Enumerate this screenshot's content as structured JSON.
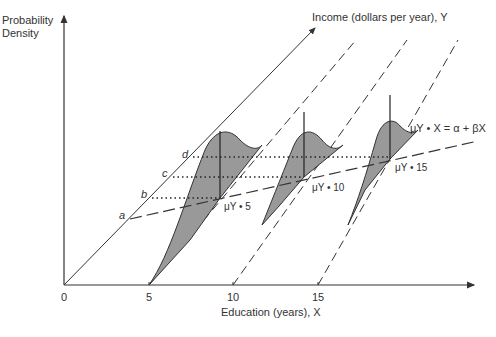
{
  "diagram": {
    "y_axis_label_line1": "Probability",
    "y_axis_label_line2": "Density",
    "income_axis_label": "Income (dollars per year), Y",
    "x_axis_label": "Education (years), X",
    "x_ticks": [
      "0",
      "5",
      "10",
      "15"
    ],
    "point_labels": [
      "a",
      "b",
      "c",
      "d"
    ],
    "mean_labels": {
      "mu5": "μY • 5",
      "mu10": "μY • 10",
      "mu15": "μY • 15"
    },
    "regression_label": "μY • X = α + βX",
    "shading_color": "#999999",
    "line_color": "#333333"
  }
}
